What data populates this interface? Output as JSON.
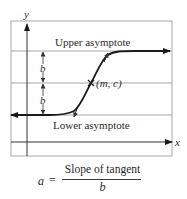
{
  "diagram": {
    "axes": {
      "y_label": "y",
      "x_label": "x"
    },
    "labels": {
      "upper_asymptote": "Upper asymptote",
      "lower_asymptote": "Lower asymptote",
      "inflection_point": "(m, c)",
      "b_upper": "b",
      "b_lower": "b"
    },
    "formula": {
      "lhs": "a",
      "equals": "=",
      "numerator": "Slope of tangent",
      "denominator": "b"
    },
    "colors": {
      "curve": "#1a1a1a",
      "grid": "#a8a8a8",
      "axis": "#333333",
      "text": "#2a2a2a"
    }
  }
}
